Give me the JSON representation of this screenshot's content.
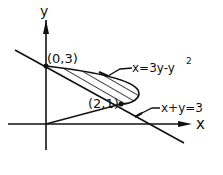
{
  "diagram": {
    "axes": {
      "x_label": "x",
      "y_label": "y"
    },
    "points": [
      {
        "label": "(0,3)",
        "x": 0,
        "y": 3
      },
      {
        "label": "(2,1)",
        "x": 2,
        "y": 1
      }
    ],
    "curves": [
      {
        "label": "x=3y-y",
        "superscript": "2",
        "type": "parabola"
      },
      {
        "label": "x+y=3",
        "type": "line"
      }
    ],
    "shaded_region": "area between x=3y-y^2 and x+y=3 for 1 ≤ y ≤ 3",
    "colors": {
      "ink": "#111111",
      "background": "#ffffff"
    }
  }
}
